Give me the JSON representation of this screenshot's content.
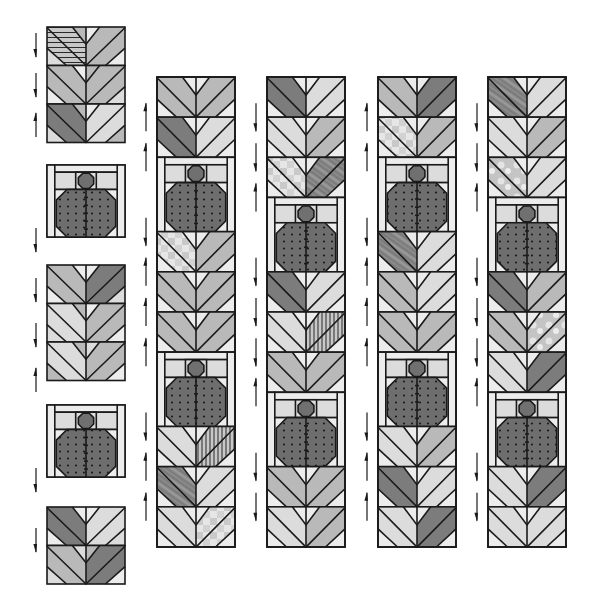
{
  "diagram": {
    "type": "quilt-assembly",
    "colors": {
      "outline": "#1a1a1a",
      "light": "#dcdcdc",
      "lighter": "#ececec",
      "mid": "#b9b9b9",
      "midDark": "#9a9a9a",
      "dark": "#7c7c7c",
      "bugBody": "#6e6e6e",
      "bugHead": "#707070",
      "dot": "#1a1a1a",
      "arrow": "#1a1a1a"
    },
    "left_column": {
      "x": 47,
      "width": 78,
      "units": [
        {
          "type": "chevron-group",
          "y": 27,
          "rows": [
            {
              "left": "stripe-h",
              "right": "mid",
              "tl": "mid",
              "tr": "lighter",
              "bl": "light",
              "br": "lighter"
            },
            {
              "left": "mid",
              "right": "mid",
              "tl": "lighter",
              "tr": "mid",
              "bl": "lighter",
              "br": "light"
            },
            {
              "left": "dark",
              "right": "light",
              "tl": "mid",
              "tr": "lighter",
              "bl": "light",
              "br": "mid"
            }
          ],
          "arrows": [
            {
              "y": 45,
              "dir": "down"
            },
            {
              "y": 85,
              "dir": "down"
            },
            {
              "y": 125,
              "dir": "up"
            }
          ]
        },
        {
          "type": "bug",
          "y": 165,
          "height": 72,
          "arrows": [
            {
              "y": 240,
              "dir": "down"
            }
          ]
        },
        {
          "type": "chevron-group",
          "y": 265,
          "rows": [
            {
              "left": "mid",
              "right": "dark",
              "tl": "lighter",
              "tr": "lighter",
              "bl": "lighter",
              "br": "light"
            },
            {
              "left": "light",
              "right": "mid",
              "tl": "mid",
              "tr": "lighter",
              "bl": "light",
              "br": "lighter"
            },
            {
              "left": "light",
              "right": "mid",
              "tl": "mid",
              "tr": "light",
              "bl": "mid",
              "br": "lighter"
            }
          ],
          "arrows": [
            {
              "y": 290,
              "dir": "down"
            },
            {
              "y": 335,
              "dir": "down"
            },
            {
              "y": 380,
              "dir": "up"
            }
          ]
        },
        {
          "type": "bug",
          "y": 405,
          "height": 72,
          "arrows": [
            {
              "y": 480,
              "dir": "down"
            }
          ]
        },
        {
          "type": "chevron-group",
          "y": 507,
          "rows": [
            {
              "left": "dark",
              "right": "light",
              "tl": "lighter",
              "tr": "lighter",
              "bl": "lighter",
              "br": "light"
            },
            {
              "left": "mid",
              "right": "dark",
              "tl": "light",
              "tr": "mid",
              "bl": "light",
              "br": "lighter"
            }
          ],
          "arrows": [
            {
              "y": 540,
              "dir": "down"
            }
          ]
        }
      ]
    },
    "columns": [
      {
        "name": "column-2",
        "x": 157,
        "width": 78,
        "y_top": 77,
        "y_bottom": 547,
        "sequence": [
          {
            "t": "C",
            "left": "mid",
            "right": "mid",
            "arrow": "up"
          },
          {
            "t": "C",
            "left": "dark",
            "right": "light",
            "arrow": "up"
          },
          {
            "t": "B",
            "arrow": "down"
          },
          {
            "t": "C",
            "left": "check",
            "right": "mid",
            "arrow": "up"
          },
          {
            "t": "C",
            "left": "mid",
            "right": "mid",
            "arrow": "up"
          },
          {
            "t": "C",
            "left": "mid",
            "right": "mid",
            "arrow": "up"
          },
          {
            "t": "B",
            "arrow": "down"
          },
          {
            "t": "C",
            "left": "light",
            "right": "stripe-v",
            "arrow": "up"
          },
          {
            "t": "C",
            "left": "wood",
            "right": "light",
            "arrow": "up"
          },
          {
            "t": "C",
            "left": "light",
            "right": "check",
            "arrow": "none"
          }
        ]
      },
      {
        "name": "column-3",
        "x": 267,
        "width": 78,
        "y_top": 77,
        "y_bottom": 547,
        "sequence": [
          {
            "t": "C",
            "left": "dark",
            "right": "light",
            "arrow": "down"
          },
          {
            "t": "C",
            "left": "light",
            "right": "mid",
            "arrow": "down"
          },
          {
            "t": "C",
            "left": "check",
            "right": "wood",
            "arrow": "up"
          },
          {
            "t": "B",
            "arrow": "down"
          },
          {
            "t": "C",
            "left": "dark",
            "right": "light",
            "arrow": "down"
          },
          {
            "t": "C",
            "left": "light",
            "right": "stripe-v",
            "arrow": "down"
          },
          {
            "t": "C",
            "left": "mid",
            "right": "mid",
            "arrow": "up"
          },
          {
            "t": "B",
            "arrow": "down"
          },
          {
            "t": "C",
            "left": "mid",
            "right": "mid",
            "arrow": "down"
          },
          {
            "t": "C",
            "left": "light",
            "right": "mid",
            "arrow": "none"
          }
        ]
      },
      {
        "name": "column-4",
        "x": 378,
        "width": 78,
        "y_top": 77,
        "y_bottom": 547,
        "sequence": [
          {
            "t": "C",
            "left": "mid",
            "right": "dark",
            "arrow": "up"
          },
          {
            "t": "C",
            "left": "check",
            "right": "mid",
            "arrow": "up"
          },
          {
            "t": "B",
            "arrow": "down"
          },
          {
            "t": "C",
            "left": "wood",
            "right": "light",
            "arrow": "up"
          },
          {
            "t": "C",
            "left": "mid",
            "right": "light",
            "arrow": "up"
          },
          {
            "t": "C",
            "left": "mid",
            "right": "mid",
            "arrow": "up"
          },
          {
            "t": "B",
            "arrow": "down"
          },
          {
            "t": "C",
            "left": "light",
            "right": "mid",
            "arrow": "up"
          },
          {
            "t": "C",
            "left": "dark",
            "right": "light",
            "arrow": "up"
          },
          {
            "t": "C",
            "left": "light",
            "right": "dark",
            "arrow": "none"
          }
        ]
      },
      {
        "name": "column-5",
        "x": 488,
        "width": 78,
        "y_top": 77,
        "y_bottom": 547,
        "sequence": [
          {
            "t": "C",
            "left": "wood",
            "right": "light",
            "arrow": "down"
          },
          {
            "t": "C",
            "left": "light",
            "right": "mid",
            "arrow": "down"
          },
          {
            "t": "C",
            "left": "cloud",
            "right": "light",
            "arrow": "up"
          },
          {
            "t": "B",
            "arrow": "down"
          },
          {
            "t": "C",
            "left": "dark",
            "right": "mid",
            "arrow": "down"
          },
          {
            "t": "C",
            "left": "mid",
            "right": "cloud",
            "arrow": "down"
          },
          {
            "t": "C",
            "left": "light",
            "right": "dark",
            "arrow": "up"
          },
          {
            "t": "B",
            "arrow": "down"
          },
          {
            "t": "C",
            "left": "light",
            "right": "dark",
            "arrow": "down"
          },
          {
            "t": "C",
            "left": "light",
            "right": "light",
            "arrow": "none"
          }
        ]
      }
    ]
  }
}
